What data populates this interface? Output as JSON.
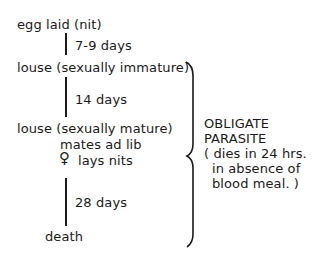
{
  "diagram": {
    "type": "life-cycle",
    "stages": [
      {
        "label": "egg laid (nit)"
      },
      {
        "label": "louse (sexually immature)"
      },
      {
        "label": "louse (sexually mature)"
      },
      {
        "label": "death"
      }
    ],
    "intervals": [
      {
        "label": "7-9 days"
      },
      {
        "label": "14 days"
      },
      {
        "label": "28 days"
      }
    ],
    "mature_notes": {
      "mates": "mates ad lib",
      "female_symbol": "♀",
      "lays": "lays nits"
    },
    "bracket_note": {
      "line1": "OBLIGATE",
      "line2": "PARASITE",
      "line3": "( dies in 24 hrs.",
      "line4": "in absence of",
      "line5": "blood meal. )"
    }
  }
}
